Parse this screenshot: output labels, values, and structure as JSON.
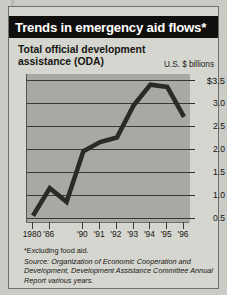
{
  "credit": "DAVID CONSTANTINE",
  "header": {
    "title": "Trends in emergency aid flows*"
  },
  "chart_data": {
    "type": "line",
    "title": "Total official development assistance (ODA)",
    "subtitle_line1": "Total official development",
    "subtitle_line2": "assistance (ODA)",
    "ylabel": "U.S. $ billions",
    "xlabel": "",
    "categories": [
      "1980",
      "'86",
      "'88",
      "'90",
      "'91",
      "'92",
      "'93",
      "'94",
      "'95",
      "'96"
    ],
    "x_tick_labels": [
      "1980",
      "'86",
      "'90",
      "'91",
      "'92",
      "'93",
      "'94",
      "'95",
      "'96"
    ],
    "values": [
      0.55,
      1.15,
      0.85,
      1.95,
      2.15,
      2.25,
      2.95,
      3.4,
      3.35,
      2.7
    ],
    "y_tick_labels": [
      "$3.5",
      "3.0",
      "2.5",
      "2.0",
      "1.5",
      "1.0",
      "0.5"
    ],
    "y_tick_values": [
      3.5,
      3.0,
      2.5,
      2.0,
      1.5,
      1.0,
      0.5
    ],
    "ylim": [
      0.35,
      3.6
    ],
    "grid": true,
    "legend": "none",
    "line_color": "#2b2a26",
    "plot_background": "#a9a9a4"
  },
  "footnote": "*Excluding food aid.",
  "source": {
    "prefix": "Source:",
    "body": " Organization of Economic Cooperation and Development, Development Assistance Committee Annual Report various years."
  },
  "colors": {
    "title_bar": "#100f0d",
    "panel": "#d6d6d1",
    "page": "#cbcbc6",
    "ink": "#16150f"
  }
}
